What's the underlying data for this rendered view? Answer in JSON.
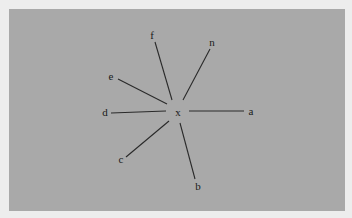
{
  "diagram": {
    "type": "star-graph",
    "colors": {
      "page_background": "#ededed",
      "panel_background": "#a9a9a9",
      "line": "#2a2a2a",
      "text": "#1a1a1a"
    },
    "center": {
      "label": "x",
      "pos": [
        178,
        112
      ]
    },
    "spokes": [
      {
        "label": "a",
        "label_pos": [
          251,
          115
        ],
        "line": [
          [
            189,
            111
          ],
          [
            244,
            111
          ]
        ]
      },
      {
        "label": "b",
        "label_pos": [
          198,
          190
        ],
        "line": [
          [
            180,
            123
          ],
          [
            195,
            179
          ]
        ]
      },
      {
        "label": "c",
        "label_pos": [
          121,
          163
        ],
        "line": [
          [
            169,
            121
          ],
          [
            126,
            157
          ]
        ]
      },
      {
        "label": "d",
        "label_pos": [
          105,
          116
        ],
        "line": [
          [
            111,
            113
          ],
          [
            166,
            111
          ]
        ]
      },
      {
        "label": "e",
        "label_pos": [
          111,
          80
        ],
        "line": [
          [
            118,
            79
          ],
          [
            167,
            104
          ]
        ]
      },
      {
        "label": "f",
        "label_pos": [
          152,
          39
        ],
        "line": [
          [
            155,
            42
          ],
          [
            172,
            100
          ]
        ]
      },
      {
        "label": "n",
        "label_pos": [
          212,
          46
        ],
        "line": [
          [
            210,
            49
          ],
          [
            183,
            100
          ]
        ]
      }
    ]
  }
}
